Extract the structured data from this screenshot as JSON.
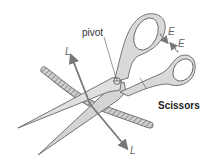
{
  "diagram": {
    "title": "Scissors",
    "labels": {
      "pivot": "pivot",
      "load_top": "L",
      "load_bottom": "L",
      "effort_top": "E",
      "effort_bottom": "E"
    },
    "colors": {
      "blade_fill": "#d9d9d9",
      "outline": "#555555",
      "arrow": "#777777",
      "rope": "#9a9a9a"
    }
  }
}
